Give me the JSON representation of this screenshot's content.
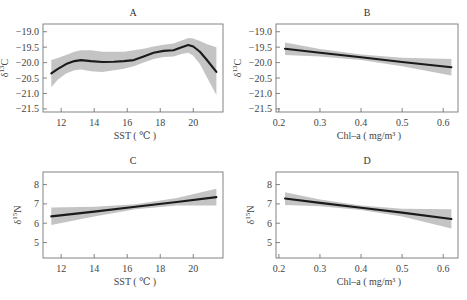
{
  "chart_data": [
    {
      "id": "A",
      "type": "line",
      "title": "A",
      "xlabel": "SST ( ℃ )",
      "ylabel": "δ¹³C",
      "ylabel_base": "δ",
      "ylabel_sup": "13",
      "ylabel_tail": "C",
      "xlim": [
        10.9,
        21.8
      ],
      "ylim": [
        -21.6,
        -18.75
      ],
      "xticks": [
        12,
        14,
        16,
        18,
        20
      ],
      "xtick_labels": [
        "12",
        "14",
        "16",
        "18",
        "20"
      ],
      "yticks": [
        -19.0,
        -19.5,
        -20.0,
        -20.5,
        -21.0,
        -21.5
      ],
      "ytick_labels": [
        "−19.0",
        "−19.5",
        "−20.0",
        "−20.5",
        "−21.0",
        "−21.5"
      ],
      "grid": false,
      "series": [
        {
          "name": "GAM smooth",
          "x": [
            11.4,
            11.8,
            12.3,
            12.8,
            13.2,
            13.8,
            14.5,
            15.2,
            15.8,
            16.4,
            17.0,
            17.6,
            18.2,
            18.8,
            19.3,
            19.7,
            20.0,
            20.4,
            20.8,
            21.4
          ],
          "y": [
            -20.35,
            -20.2,
            -20.05,
            -19.95,
            -19.92,
            -19.95,
            -19.98,
            -19.97,
            -19.95,
            -19.92,
            -19.8,
            -19.68,
            -19.62,
            -19.6,
            -19.5,
            -19.43,
            -19.48,
            -19.65,
            -19.9,
            -20.3
          ],
          "lower": [
            -20.8,
            -20.55,
            -20.35,
            -20.25,
            -20.22,
            -20.28,
            -20.3,
            -20.25,
            -20.2,
            -20.12,
            -20.0,
            -19.88,
            -19.82,
            -19.8,
            -19.72,
            -19.68,
            -19.78,
            -20.05,
            -20.45,
            -21.05
          ],
          "upper": [
            -19.92,
            -19.85,
            -19.75,
            -19.65,
            -19.6,
            -19.6,
            -19.65,
            -19.65,
            -19.65,
            -19.6,
            -19.55,
            -19.48,
            -19.42,
            -19.38,
            -19.28,
            -19.2,
            -19.22,
            -19.3,
            -19.4,
            -19.5
          ]
        }
      ]
    },
    {
      "id": "B",
      "type": "line",
      "title": "B",
      "xlabel": "Chl–a ( mg/m³ )",
      "ylabel": "δ¹³C",
      "ylabel_base": "δ",
      "ylabel_sup": "13",
      "ylabel_tail": "C",
      "xlim": [
        0.193,
        0.636
      ],
      "ylim": [
        -21.6,
        -18.75
      ],
      "xticks": [
        0.2,
        0.3,
        0.4,
        0.5,
        0.6
      ],
      "xtick_labels": [
        "0.2",
        "0.3",
        "0.4",
        "0.5",
        "0.6"
      ],
      "yticks": [
        -19.0,
        -19.5,
        -20.0,
        -20.5,
        -21.0,
        -21.5
      ],
      "ytick_labels": [
        "−19.0",
        "−19.5",
        "−20.0",
        "−20.5",
        "−21.0",
        "−21.5"
      ],
      "grid": false,
      "series": [
        {
          "name": "linear fit",
          "x": [
            0.215,
            0.3,
            0.4,
            0.5,
            0.62
          ],
          "y": [
            -19.55,
            -19.68,
            -19.83,
            -19.98,
            -20.15
          ],
          "lower": [
            -19.75,
            -19.8,
            -19.92,
            -20.12,
            -20.42
          ],
          "upper": [
            -19.35,
            -19.56,
            -19.74,
            -19.84,
            -19.88
          ]
        }
      ]
    },
    {
      "id": "C",
      "type": "line",
      "title": "C",
      "xlabel": "SST ( ℃ )",
      "ylabel": "δ¹⁵N",
      "ylabel_base": "δ",
      "ylabel_sup": "15",
      "ylabel_tail": "N",
      "xlim": [
        10.9,
        21.8
      ],
      "ylim": [
        4.2,
        8.65
      ],
      "xticks": [
        12,
        14,
        16,
        18,
        20
      ],
      "xtick_labels": [
        "12",
        "14",
        "16",
        "18",
        "20"
      ],
      "yticks": [
        8,
        7,
        6,
        5
      ],
      "ytick_labels": [
        "8",
        "7",
        "6",
        "5"
      ],
      "grid": false,
      "series": [
        {
          "name": "linear fit",
          "x": [
            11.4,
            14.0,
            16.5,
            19.0,
            21.4
          ],
          "y": [
            6.35,
            6.6,
            6.85,
            7.1,
            7.35
          ],
          "lower": [
            5.9,
            6.35,
            6.72,
            6.92,
            6.92
          ],
          "upper": [
            6.82,
            6.85,
            6.98,
            7.3,
            7.78
          ]
        }
      ]
    },
    {
      "id": "D",
      "type": "line",
      "title": "D",
      "xlabel": "Chl–a ( mg/m³ )",
      "ylabel": "δ¹⁵N",
      "ylabel_base": "δ",
      "ylabel_sup": "15",
      "ylabel_tail": "N",
      "xlim": [
        0.193,
        0.636
      ],
      "ylim": [
        4.2,
        8.65
      ],
      "xticks": [
        0.2,
        0.3,
        0.4,
        0.5,
        0.6
      ],
      "xtick_labels": [
        "0.2",
        "0.3",
        "0.4",
        "0.5",
        "0.6"
      ],
      "yticks": [
        8,
        7,
        6,
        5
      ],
      "ytick_labels": [
        "8",
        "7",
        "6",
        "5"
      ],
      "grid": false,
      "series": [
        {
          "name": "linear fit",
          "x": [
            0.215,
            0.3,
            0.4,
            0.5,
            0.62
          ],
          "y": [
            7.28,
            7.05,
            6.8,
            6.55,
            6.22
          ],
          "lower": [
            6.95,
            6.88,
            6.68,
            6.35,
            5.72
          ],
          "upper": [
            7.6,
            7.22,
            6.92,
            6.75,
            6.72
          ]
        }
      ]
    }
  ],
  "layout": {
    "panels": [
      {
        "id": "A",
        "frame": [
          43,
          24,
          223,
          112
        ]
      },
      {
        "id": "B",
        "frame": [
          276,
          24,
          458,
          112
        ]
      },
      {
        "id": "C",
        "frame": [
          43,
          172,
          223,
          258
        ]
      },
      {
        "id": "D",
        "frame": [
          276,
          172,
          458,
          258
        ]
      }
    ]
  },
  "colors": {
    "line": "#1a1a1a",
    "band": "#c4c4c4",
    "frame": "#777777",
    "text": "#444444"
  }
}
